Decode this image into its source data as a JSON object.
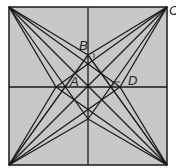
{
  "figure": {
    "labels": {
      "A": "A",
      "B": "B",
      "C": "C",
      "D": "D"
    },
    "fill_color": "#c4c4c4",
    "line_color": "#1a1a1a"
  }
}
